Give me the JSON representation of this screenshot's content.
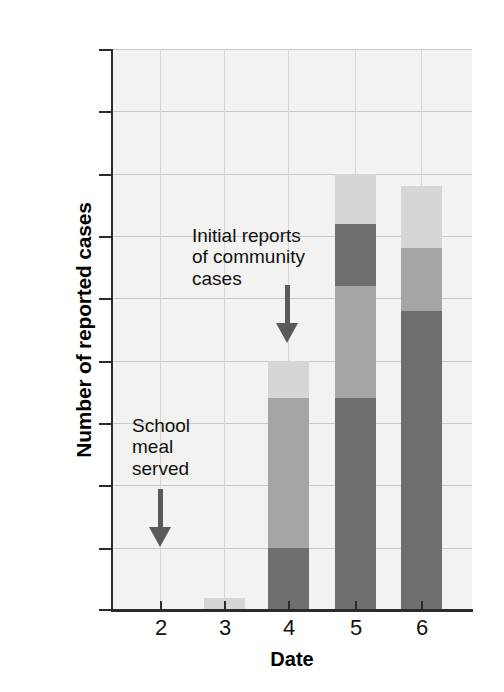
{
  "chart_data": {
    "type": "bar",
    "subtype": "stacked-bar",
    "title": "",
    "xlabel": "Date",
    "ylabel": "Number of reported cases",
    "categories": [
      "2",
      "3",
      "4",
      "5",
      "6"
    ],
    "ylim": [
      0,
      45
    ],
    "yticks": [
      0,
      5,
      10,
      15,
      20,
      25,
      30,
      35,
      40,
      45
    ],
    "ytick_labels": [
      "0",
      "5",
      "10",
      "15",
      "20",
      "25",
      "30",
      "35",
      "40",
      "45"
    ],
    "grid": true,
    "legend": "none",
    "colors": {
      "dark": "#6f6f6f",
      "medium": "#a5a5a5",
      "light": "#d6d6d6",
      "plot_background": "#f2f2f1",
      "axis": "#2b2b2b",
      "gridline": "#c9c9c7",
      "arrow": "#5a5a5a"
    },
    "totals": [
      0,
      1,
      20,
      35,
      34
    ],
    "stacks": [
      {
        "category": "2",
        "segments": []
      },
      {
        "category": "3",
        "segments": [
          {
            "from": 0,
            "to": 1,
            "value": 1,
            "shade": "light"
          }
        ]
      },
      {
        "category": "4",
        "segments": [
          {
            "from": 0,
            "to": 5,
            "value": 5,
            "shade": "dark"
          },
          {
            "from": 5,
            "to": 17,
            "value": 12,
            "shade": "medium"
          },
          {
            "from": 17,
            "to": 20,
            "value": 3,
            "shade": "light"
          }
        ]
      },
      {
        "category": "5",
        "segments": [
          {
            "from": 0,
            "to": 17,
            "value": 17,
            "shade": "dark"
          },
          {
            "from": 17,
            "to": 26,
            "value": 9,
            "shade": "medium"
          },
          {
            "from": 26,
            "to": 31,
            "value": 5,
            "shade": "dark"
          },
          {
            "from": 31,
            "to": 35,
            "value": 4,
            "shade": "light"
          }
        ]
      },
      {
        "category": "6",
        "segments": [
          {
            "from": 0,
            "to": 24,
            "value": 24,
            "shade": "dark"
          },
          {
            "from": 24,
            "to": 29,
            "value": 5,
            "shade": "medium"
          },
          {
            "from": 29,
            "to": 34,
            "value": 5,
            "shade": "light"
          }
        ]
      }
    ],
    "annotations": [
      {
        "id": "school-meal",
        "text": "School\nmeal\nserved",
        "points_to_category": "2",
        "arrow": "down"
      },
      {
        "id": "initial-reports",
        "text": "Initial reports\nof community\ncases",
        "points_to_category": "4",
        "arrow": "down"
      }
    ]
  }
}
